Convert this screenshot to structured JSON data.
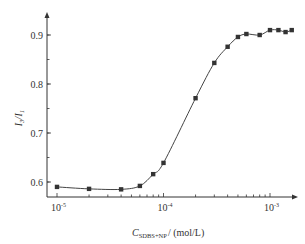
{
  "chart_data": {
    "type": "line",
    "title": "",
    "xlabel": "C_SDBS+NP / (mol/L)",
    "ylabel": "I3/I1",
    "xscale": "log",
    "xlim": [
      8.5e-06,
      0.0017
    ],
    "ylim": [
      0.555,
      0.945
    ],
    "x_ticks": [
      1e-05,
      0.0001,
      0.001
    ],
    "x_tick_labels": [
      "10^-5",
      "10^-4",
      "10^-3"
    ],
    "y_ticks": [
      0.6,
      0.7,
      0.8,
      0.9
    ],
    "y_tick_labels": [
      "0.6",
      "0.7",
      "0.8",
      "0.9"
    ],
    "grid": false,
    "legend": null,
    "series": [
      {
        "name": "I3/I1",
        "marker": "square",
        "color": "#333333",
        "x": [
          1e-05,
          2e-05,
          4e-05,
          6e-05,
          8e-05,
          0.0001,
          0.0002,
          0.0003,
          0.0004,
          0.0005,
          0.0006,
          0.0008,
          0.001,
          0.0012,
          0.0014,
          0.0016
        ],
        "y": [
          0.59,
          0.586,
          0.585,
          0.592,
          0.616,
          0.639,
          0.771,
          0.843,
          0.876,
          0.896,
          0.902,
          0.9,
          0.91,
          0.91,
          0.906,
          0.91
        ]
      }
    ]
  },
  "labels": {
    "y_axis_main": "I",
    "y_axis_sub1": "3",
    "y_axis_slash": "/",
    "y_axis_main2": "I",
    "y_axis_sub2": "1",
    "x_axis_main": "C",
    "x_axis_sub": "SDBS+NP",
    "x_axis_unit": "/ (mol/L)",
    "x_tick_base": "10",
    "x_tick_exps": [
      "-5",
      "-4",
      "-3"
    ]
  }
}
